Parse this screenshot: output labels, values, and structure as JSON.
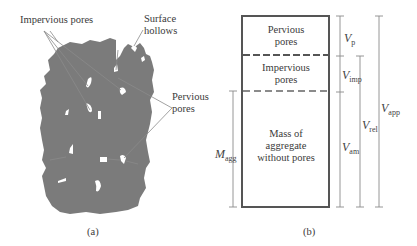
{
  "panel_a": {
    "caption": "(a)",
    "labels": {
      "impervious_pores": "Impervious pores",
      "surface_hollows_line1": "Surface",
      "surface_hollows_line2": "hollows",
      "pervious_pores_line1": "Pervious",
      "pervious_pores_line2": "pores"
    },
    "colors": {
      "aggregate": "#7b7b7b",
      "pore": "#ffffff",
      "leader": "#8a8a8a"
    }
  },
  "panel_b": {
    "caption": "(b)",
    "sections": [
      {
        "line1": "Pervious",
        "line2": "pores"
      },
      {
        "line1": "Impervious",
        "line2": "pores"
      },
      {
        "line1": "Mass of",
        "line2": "aggregate",
        "line3": "without pores"
      }
    ],
    "dimensions": {
      "m_agg": {
        "symbol": "M",
        "sub": "agg"
      },
      "v_p": {
        "symbol": "V",
        "sub": "p"
      },
      "v_imp": {
        "symbol": "V",
        "sub": "imp"
      },
      "v_am": {
        "symbol": "V",
        "sub": "am"
      },
      "v_rel": {
        "symbol": "V",
        "sub": "rel"
      },
      "v_app": {
        "symbol": "V",
        "sub": "app"
      }
    },
    "colors": {
      "box_border": "#555555",
      "dim_line": "#8a8a8a"
    }
  }
}
